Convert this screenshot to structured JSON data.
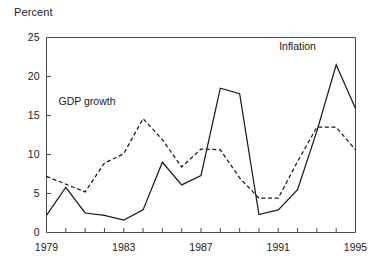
{
  "chart_data": {
    "type": "line",
    "title": "",
    "subtitle": "",
    "xlabel": "",
    "ylabel": "Percent",
    "ylim": [
      0,
      25
    ],
    "xlim": [
      1979,
      1995
    ],
    "yticks": [
      0,
      5,
      10,
      15,
      20,
      25
    ],
    "ytick_labels": [
      "0",
      "5",
      "10",
      "15",
      "20",
      "25"
    ],
    "xticks": [
      1979,
      1980,
      1981,
      1982,
      1983,
      1984,
      1985,
      1986,
      1987,
      1988,
      1989,
      1990,
      1991,
      1992,
      1993,
      1994,
      1995
    ],
    "xtick_labels": [
      "1979",
      "1983",
      "1987",
      "1991",
      "1995"
    ],
    "xtick_labeled_values": [
      1979,
      1983,
      1987,
      1991,
      1995
    ],
    "grid": false,
    "legend_position": "inline-annotation",
    "x": [
      1979,
      1980,
      1981,
      1982,
      1983,
      1984,
      1985,
      1986,
      1987,
      1988,
      1989,
      1990,
      1991,
      1992,
      1993,
      1994,
      1995
    ],
    "series": [
      {
        "name": "Inflation",
        "style": "solid",
        "color": "#1a1a1a",
        "values": [
          2.2,
          5.8,
          2.5,
          2.2,
          1.6,
          2.9,
          9.0,
          6.1,
          7.3,
          18.5,
          17.8,
          2.3,
          2.9,
          5.5,
          13.0,
          21.5,
          15.9
        ]
      },
      {
        "name": "GDP growth",
        "style": "dashed",
        "color": "#1a1a1a",
        "values": [
          7.2,
          6.2,
          5.2,
          8.9,
          10.1,
          14.6,
          11.9,
          8.4,
          10.7,
          10.6,
          7.0,
          4.4,
          4.4,
          9.1,
          13.5,
          13.5,
          10.6
        ]
      }
    ],
    "annotations": [
      {
        "text": "Inflation",
        "x": 1992.0,
        "y": 23.4
      },
      {
        "text": "GDP growth",
        "x": 1981.1,
        "y": 16.4
      }
    ]
  }
}
